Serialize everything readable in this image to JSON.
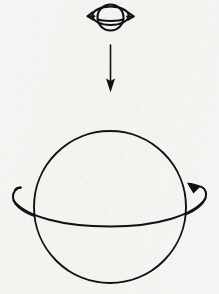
{
  "figure": {
    "background_color": "#f6f5f3",
    "ink_color": "#111010",
    "canvas": {
      "width": 219,
      "height": 294
    },
    "elements": {
      "small_sphere": {
        "label": "small-rotating-sphere",
        "center_x": 110.5,
        "center_y": 17.5,
        "radius": 13,
        "stroke_width": 2.1,
        "ring": {
          "label": "equatorial-ring",
          "radius_x": 20,
          "radius_y": 5.2,
          "center_y": 19.5
        },
        "arrowheads": [
          {
            "label": "ring-arrow-left",
            "direction": "left",
            "x": 90,
            "y": 17
          },
          {
            "label": "ring-arrow-right",
            "direction": "right",
            "x": 131,
            "y": 17
          }
        ]
      },
      "down_arrow": {
        "label": "downward-transition-arrow",
        "x": 110.5,
        "y_start": 45,
        "y_end": 91,
        "stroke_width": 1.6,
        "head_width": 9,
        "head_length": 11
      },
      "large_sphere": {
        "label": "large-rotating-sphere",
        "center_x": 110,
        "center_y": 207,
        "radius": 76,
        "stroke_width": 1.9,
        "ring": {
          "label": "equatorial-ring",
          "radius_x": 99,
          "radius_y": 22,
          "center_y": 215
        },
        "arrowheads": [
          {
            "label": "ring-arrow-right",
            "direction": "up-left",
            "x": 196,
            "y": 188
          }
        ],
        "tail": {
          "label": "ring-tail-left",
          "x": 15,
          "y": 190
        }
      }
    }
  },
  "meta": {
    "caption": ""
  }
}
